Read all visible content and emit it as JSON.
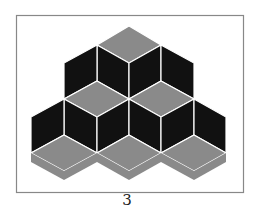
{
  "figure": {
    "label": "3",
    "colors": {
      "frame": "#888888",
      "dark_face": "#111111",
      "gray_face": "#8a8a8a",
      "background": "#ffffff"
    }
  }
}
